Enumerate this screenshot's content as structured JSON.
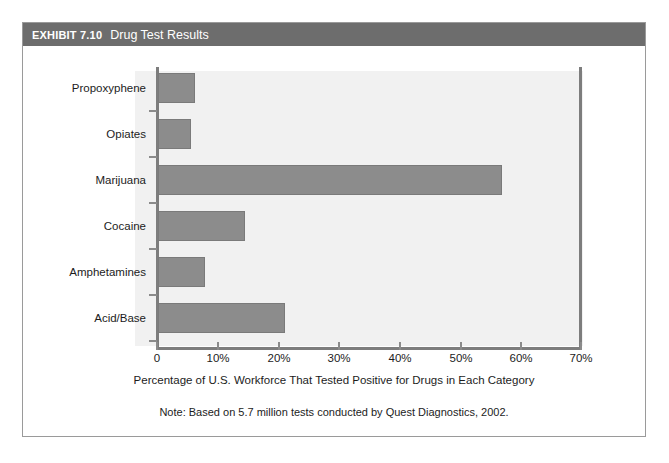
{
  "exhibit": {
    "number": "EXHIBIT 7.10",
    "title": "Drug Test Results"
  },
  "colors": {
    "header_bar": "#6d6d6d",
    "bar_fill": "#8c8c8c",
    "plot_background": "#f1f1f1",
    "axis_line": "#7d7d7d",
    "frame_border": "#9a9a9a"
  },
  "chart_data": {
    "type": "bar",
    "orientation": "horizontal",
    "title": "Drug Test Results",
    "categories": [
      "Propoxyphene",
      "Opiates",
      "Marijuana",
      "Cocaine",
      "Amphetamines",
      "Acid/Base"
    ],
    "values": [
      6.1,
      5.5,
      57.0,
      14.4,
      7.7,
      21.0
    ],
    "xlabel": "Percentage of U.S. Workforce That Tested Positive for Drugs in Each Category",
    "ylabel": "",
    "xlim": [
      0,
      70
    ],
    "xticks": [
      0,
      10,
      20,
      30,
      40,
      50,
      60,
      70
    ],
    "xtick_labels": [
      "0",
      "10%",
      "20%",
      "30%",
      "40%",
      "50%",
      "60%",
      "70%"
    ],
    "grid": false,
    "legend": null,
    "note": "Note: Based on 5.7 million tests conducted by Quest Diagnostics, 2002."
  }
}
